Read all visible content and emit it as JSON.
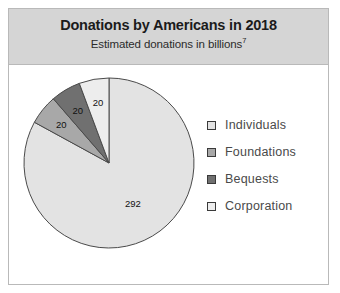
{
  "figure": {
    "title": "Donations by Americans in 2018",
    "subtitle": "Estimated donations in billions",
    "subtitle_superscript": "7",
    "border_color": "#b9b9b9",
    "header_background": "#d5d5d5"
  },
  "chart_data": {
    "type": "pie",
    "title": "Donations by Americans in 2018",
    "subtitle": "Estimated donations in billions",
    "unit": "billions of US dollars",
    "categories": [
      "Individuals",
      "Foundations",
      "Bequests",
      "Corporation"
    ],
    "values": [
      292,
      20,
      20,
      20
    ],
    "labels": [
      "292",
      "20",
      "20",
      "20"
    ],
    "colors": [
      "#e3e3e3",
      "#a8a8a8",
      "#707070",
      "#ededed"
    ],
    "legend_position": "right",
    "start_angle_deg": 0,
    "direction": "clockwise",
    "slices": [
      {
        "name": "Individuals",
        "value": 292,
        "label": "292",
        "color": "#e3e3e3",
        "label_color": "#111111"
      },
      {
        "name": "Foundations",
        "value": 20,
        "label": "20",
        "color": "#a8a8a8",
        "label_color": "#111111"
      },
      {
        "name": "Bequests",
        "value": 20,
        "label": "20",
        "color": "#707070",
        "label_color": "#ffffff"
      },
      {
        "name": "Corporation",
        "value": 20,
        "label": "20",
        "color": "#ededed",
        "label_color": "#111111"
      }
    ]
  },
  "legend": {
    "items": [
      {
        "label": "Individuals",
        "color": "#e3e3e3"
      },
      {
        "label": "Foundations",
        "color": "#a8a8a8"
      },
      {
        "label": "Bequests",
        "color": "#707070"
      },
      {
        "label": "Corporation",
        "color": "#ededed"
      }
    ]
  }
}
